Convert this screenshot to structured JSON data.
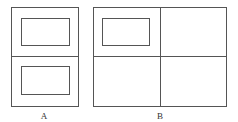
{
  "diagrams": [
    {
      "id": "A",
      "label": "A"
    },
    {
      "id": "B",
      "label": "B"
    }
  ],
  "colors": {
    "stroke": "#555555",
    "background": "#ffffff"
  }
}
